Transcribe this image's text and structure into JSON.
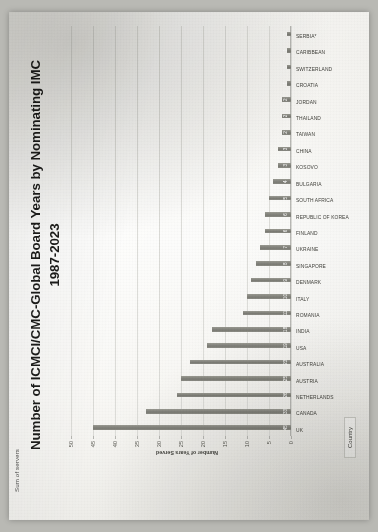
{
  "sheet": {
    "sum_label": "Sum of servers",
    "legend_label": "Country"
  },
  "chart_data": {
    "type": "bar",
    "title": "Number of ICMCI/CMC-Global Board Years by Nominating IMC 1987-2023",
    "title_line1": "Number of ICMCI/CMC-Global Board Years by Nominating IMC",
    "title_line2": "1987-2023",
    "xlabel": "Country",
    "ylabel": "Number of Years Served",
    "ylim": [
      0,
      50
    ],
    "yticks": [
      0,
      5,
      10,
      15,
      20,
      25,
      30,
      35,
      40,
      45,
      50
    ],
    "grid": true,
    "legend": "Country",
    "bar_color": "#7b7b74",
    "categories": [
      "UK",
      "CANADA",
      "NETHERLANDS",
      "AUSTRIA",
      "AUSTRALIA",
      "USA",
      "INDIA",
      "ROMANIA",
      "ITALY",
      "DENMARK",
      "SINGAPORE",
      "UKRAINE",
      "FINLAND",
      "REPUBLIC OF KOREA",
      "SOUTH AFRICA",
      "BULGARIA",
      "KOSOVO",
      "CHINA",
      "TAIWAN",
      "THAILAND",
      "JORDAN",
      "CROATIA",
      "SWITZERLAND",
      "CARIBBEAN",
      "SERBIA*"
    ],
    "values": [
      45,
      33,
      26,
      25,
      23,
      19,
      18,
      11,
      10,
      9,
      8,
      7,
      6,
      6,
      5,
      4,
      3,
      3,
      2,
      2,
      2,
      1,
      1,
      1,
      1
    ]
  }
}
